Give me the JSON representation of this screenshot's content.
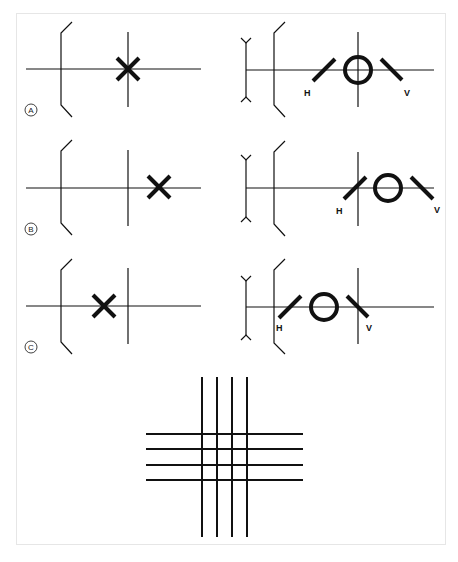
{
  "figure": {
    "panels": [
      {
        "id": "A",
        "label": "A",
        "object_marker": "x-mark",
        "cardinal_position": "on-principal-vertical",
        "h_label": "H",
        "v_label": "V"
      },
      {
        "id": "B",
        "label": "B",
        "object_marker": "x-mark",
        "cardinal_position": "behind-principal-vertical",
        "h_label": "H",
        "v_label": "V"
      },
      {
        "id": "C",
        "label": "C",
        "object_marker": "x-mark",
        "cardinal_position": "in-front-of-principal-vertical",
        "h_label": "H",
        "v_label": "V"
      }
    ],
    "grid": {
      "vertical_lines": 4,
      "horizontal_lines": 4
    },
    "colors": {
      "line": "#111111",
      "frame": "#e6e6e6",
      "background": "#ffffff"
    }
  }
}
